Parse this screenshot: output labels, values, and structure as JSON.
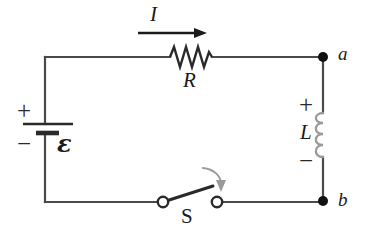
{
  "figure": {
    "kind": "circuit-diagram",
    "background_color": "#ffffff",
    "wire_color": "#4a4a4a",
    "component_color": "#2a2a2a",
    "coil_color": "#9a9a9a",
    "arrow_color": "#9a9a9a"
  },
  "labels": {
    "current": "I",
    "resistor": "R",
    "inductor": "L",
    "switch": "S",
    "emf": "ε",
    "node_a": "a",
    "node_b": "b"
  },
  "polarity": {
    "battery_positive": "+",
    "battery_negative": "−",
    "inductor_positive": "+",
    "inductor_negative": "−"
  },
  "components": [
    {
      "name": "battery",
      "symbol": "emf-source",
      "label": "ε",
      "terminals": [
        "+",
        "−"
      ]
    },
    {
      "name": "resistor",
      "symbol": "zigzag",
      "label": "R"
    },
    {
      "name": "inductor",
      "symbol": "coil",
      "label": "L",
      "terminals": [
        "+",
        "−"
      ]
    },
    {
      "name": "switch",
      "symbol": "spst-open",
      "label": "S",
      "state": "open"
    }
  ],
  "nodes": [
    {
      "name": "a",
      "label": "a"
    },
    {
      "name": "b",
      "label": "b"
    }
  ],
  "annotations": [
    {
      "name": "current-arrow",
      "label": "I",
      "direction": "right"
    },
    {
      "name": "closing-arrow",
      "label": "",
      "direction": "curved-down-right"
    }
  ]
}
